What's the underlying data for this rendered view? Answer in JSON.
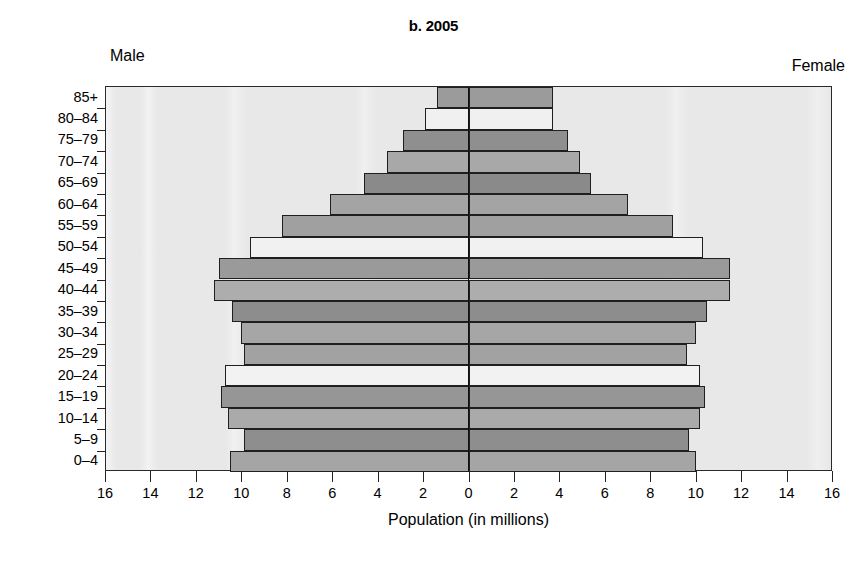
{
  "chart_data": {
    "type": "bar",
    "subtype": "population-pyramid",
    "title": "b. 2005",
    "xlabel": "Population (in millions)",
    "ylabel": "",
    "grid": false,
    "legend_position": "inline-top-corners",
    "left_side_label": "Male",
    "right_side_label": "Female",
    "xlim": [
      -16,
      16
    ],
    "xtick_labels": [
      "16",
      "14",
      "12",
      "10",
      "8",
      "6",
      "4",
      "2",
      "0",
      "2",
      "4",
      "6",
      "8",
      "10",
      "12",
      "14",
      "16"
    ],
    "xtick_values": [
      -16,
      -14,
      -12,
      -10,
      -8,
      -6,
      -4,
      -2,
      0,
      2,
      4,
      6,
      8,
      10,
      12,
      14,
      16
    ],
    "categories": [
      "85+",
      "80–84",
      "75–79",
      "70–74",
      "65–69",
      "60–64",
      "55–59",
      "50–54",
      "45–49",
      "40–44",
      "35–39",
      "30–34",
      "25–29",
      "20–24",
      "15–19",
      "10–14",
      "5–9",
      "0–4"
    ],
    "series": [
      {
        "name": "Male",
        "side": "left",
        "values": [
          1.4,
          1.9,
          2.9,
          3.6,
          4.6,
          6.1,
          8.2,
          9.6,
          11.0,
          11.2,
          10.4,
          10.0,
          9.9,
          10.7,
          10.9,
          10.6,
          9.9,
          10.5
        ]
      },
      {
        "name": "Female",
        "side": "right",
        "values": [
          3.7,
          3.7,
          4.4,
          4.9,
          5.4,
          7.0,
          9.0,
          10.3,
          11.5,
          11.5,
          10.5,
          10.0,
          9.6,
          10.2,
          10.4,
          10.2,
          9.7,
          10.0
        ]
      }
    ],
    "bar_shades": [
      "#9b9b9b",
      "#f0f0f0",
      "#8f8f8f",
      "#a8a8a8",
      "#8a8a8a",
      "#a4a4a4",
      "#a0a0a0",
      "#f1f1f1",
      "#9a9a9a",
      "#adadad",
      "#8d8d8d",
      "#a6a6a6",
      "#a2a2a2",
      "#f2f2f2",
      "#969696",
      "#aaaaaa",
      "#8e8e8e",
      "#a5a5a5"
    ],
    "plot_background": "#e8e8e8",
    "axis_color": "#222222"
  }
}
